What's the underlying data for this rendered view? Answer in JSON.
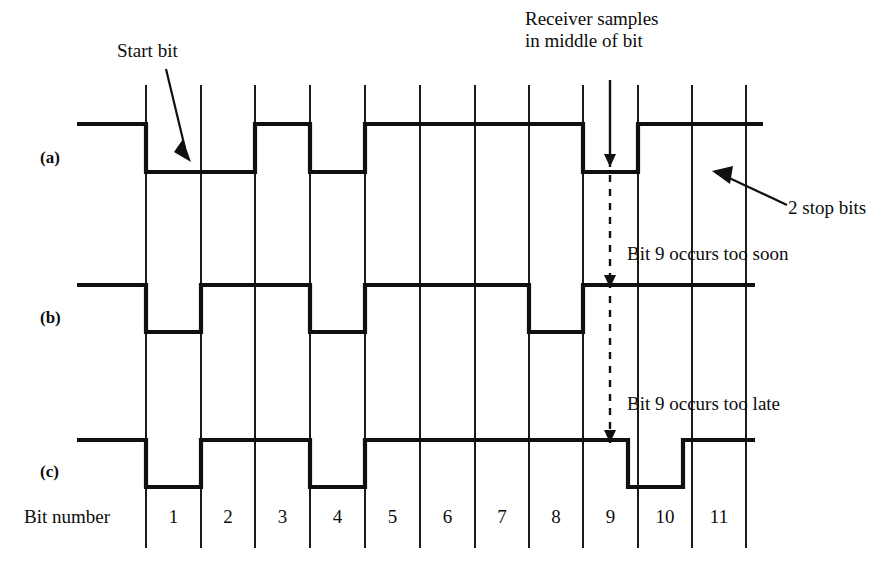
{
  "figure": {
    "title_annotations": {
      "start_bit": "Start bit",
      "receiver_samples_line1": "Receiver samples",
      "receiver_samples_line2": "in middle of bit",
      "stop_bits": "2 stop bits",
      "too_soon": "Bit 9 occurs too soon",
      "too_late": "Bit 9 occurs too late"
    },
    "axis": {
      "bit_number_label": "Bit number",
      "bit_numbers": [
        "1",
        "2",
        "3",
        "4",
        "5",
        "6",
        "7",
        "8",
        "9",
        "10",
        "11"
      ]
    },
    "waveforms": [
      {
        "id": "a",
        "label": "(a)",
        "description": "ideal transmitted waveform",
        "high_level": 124,
        "low_level": 172,
        "start_x": 77,
        "end_x": 763,
        "transitions": [
          {
            "x": 146,
            "to": "low"
          },
          {
            "x": 255,
            "to": "high"
          },
          {
            "x": 310,
            "to": "low"
          },
          {
            "x": 365,
            "to": "high"
          },
          {
            "x": 583,
            "to": "low"
          },
          {
            "x": 638,
            "to": "high"
          }
        ]
      },
      {
        "id": "b",
        "label": "(b)",
        "description": "waveform where bit 9 occurs too soon",
        "high_level": 285,
        "low_level": 332,
        "start_x": 77,
        "end_x": 755,
        "transitions": [
          {
            "x": 146,
            "to": "low"
          },
          {
            "x": 201,
            "to": "high"
          },
          {
            "x": 310,
            "to": "low"
          },
          {
            "x": 365,
            "to": "high"
          },
          {
            "x": 529,
            "to": "low"
          },
          {
            "x": 583,
            "to": "high"
          }
        ]
      },
      {
        "id": "c",
        "label": "(c)",
        "description": "waveform where bit 9 occurs too late",
        "high_level": 440,
        "low_level": 487,
        "start_x": 77,
        "end_x": 755,
        "transitions": [
          {
            "x": 146,
            "to": "low"
          },
          {
            "x": 201,
            "to": "high"
          },
          {
            "x": 310,
            "to": "low"
          },
          {
            "x": 365,
            "to": "high"
          },
          {
            "x": 628,
            "to": "low"
          },
          {
            "x": 683,
            "to": "high"
          }
        ]
      }
    ],
    "grid": {
      "x_positions": [
        146,
        201,
        255,
        310,
        365,
        420,
        475,
        529,
        583,
        638,
        692,
        746
      ],
      "y_top": 85,
      "y_bottom": 548
    },
    "sample_marker": {
      "x": 610,
      "solid_top": 80,
      "solid_arrow_y": 167,
      "dashed_top": 175,
      "dashed_arrow_y": 288,
      "dashed2_top": 296,
      "dashed2_arrow_y": 443
    },
    "colors": {
      "ink": "#101010",
      "background": "#ffffff",
      "grid": "#1a1a1a"
    }
  }
}
